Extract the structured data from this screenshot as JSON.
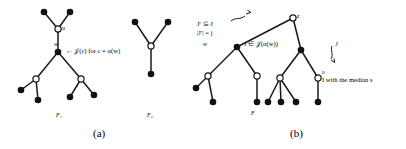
{
  "figure": {
    "panels": [
      {
        "id": "panel-a",
        "caption": "(a)",
        "forests": [
          {
            "name": "F_1",
            "label": "F₁"
          },
          {
            "name": "F_2",
            "label": "F₂"
          }
        ],
        "node_labels": [
          {
            "name": "node-label-u",
            "text": "u"
          },
          {
            "name": "node-label-w",
            "text": "w"
          }
        ],
        "annotations": [
          {
            "name": "annotation-j-of-c",
            "text": "← 𝒥(c) for c = α(w)"
          }
        ]
      },
      {
        "id": "panel-b",
        "caption": "(b)",
        "forests": [
          {
            "name": "F",
            "label": "F"
          }
        ],
        "node_labels": [
          {
            "name": "node-label-z",
            "text": "z"
          },
          {
            "name": "node-label-w",
            "text": "w"
          },
          {
            "name": "node-label-u",
            "text": "u"
          }
        ],
        "annotations": [
          {
            "name": "annotation-jprime-subset",
            "text": "J′ ⊆ J"
          },
          {
            "name": "annotation-jprime-cardinality",
            "text": "|J′| = j"
          },
          {
            "name": "annotation-j-in-j-alpha-w",
            "text": "J ∈ 𝒥(α(w))"
          },
          {
            "name": "annotation-j-pointer",
            "text": "J"
          },
          {
            "name": "annotation-i-median",
            "text": "I with the median s"
          }
        ]
      }
    ],
    "colors": {
      "stroke": "#1a1a1a",
      "node_fill_solid": "#111111",
      "node_fill_hollow": "#ffffff",
      "background": "#ffffff"
    }
  }
}
